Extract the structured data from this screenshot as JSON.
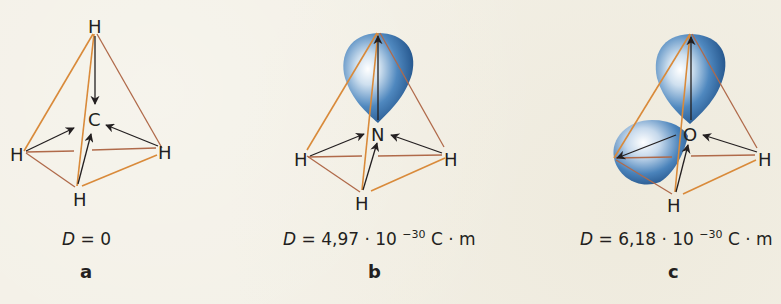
{
  "figure": {
    "background": "#f3f0e6",
    "edge_color": "#d98a3a",
    "edge_back_color": "#b06a4a",
    "orbital_color": "#3d78b0",
    "arrow_color": "#231f20",
    "panels": [
      {
        "id": "a",
        "label": "a",
        "central_atom": "C",
        "substituents": [
          "H",
          "H",
          "H",
          "H"
        ],
        "lone_pairs": 0,
        "dipole": {
          "symbol": "D",
          "equals": "=",
          "value": "0",
          "exponent": "",
          "unit": ""
        }
      },
      {
        "id": "b",
        "label": "b",
        "central_atom": "N",
        "substituents": [
          "H",
          "H",
          "H"
        ],
        "lone_pairs": 1,
        "dipole": {
          "symbol": "D",
          "equals": "=",
          "value": "4,97 · 10",
          "exponent": "−30",
          "unit": " C · m"
        }
      },
      {
        "id": "c",
        "label": "c",
        "central_atom": "O",
        "substituents": [
          "H",
          "H"
        ],
        "lone_pairs": 2,
        "dipole": {
          "symbol": "D",
          "equals": "=",
          "value": "6,18 · 10",
          "exponent": "−30",
          "unit": " C · m"
        }
      }
    ]
  }
}
